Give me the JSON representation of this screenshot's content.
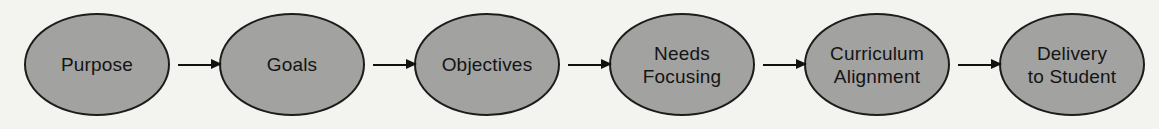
{
  "diagram": {
    "type": "flowchart",
    "direction": "left-to-right",
    "nodes": [
      {
        "id": "purpose",
        "label": "Purpose"
      },
      {
        "id": "goals",
        "label": "Goals"
      },
      {
        "id": "objectives",
        "label": "Objectives"
      },
      {
        "id": "needs-focusing",
        "label": "Needs\nFocusing"
      },
      {
        "id": "curriculum-alignment",
        "label": "Curriculum\nAlignment"
      },
      {
        "id": "delivery-to-student",
        "label": "Delivery\nto Student"
      }
    ],
    "edges": [
      {
        "from": "purpose",
        "to": "goals"
      },
      {
        "from": "goals",
        "to": "objectives"
      },
      {
        "from": "objectives",
        "to": "needs-focusing"
      },
      {
        "from": "needs-focusing",
        "to": "curriculum-alignment"
      },
      {
        "from": "curriculum-alignment",
        "to": "delivery-to-student"
      }
    ]
  },
  "colors": {
    "background": "#f3f3f0",
    "node_fill": "#a2a2a0",
    "node_stroke": "#1c1c1c",
    "text": "#141414",
    "arrow": "#111111"
  }
}
